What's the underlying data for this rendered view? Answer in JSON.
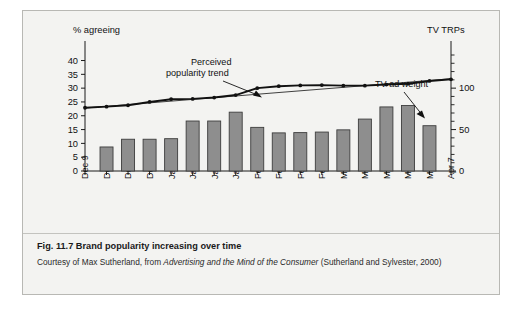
{
  "figure": {
    "caption_number": "Fig. 11.7",
    "caption_title": "Brand popularity increasing over time",
    "credit_prefix": "Courtesy of Max Sutherland, from ",
    "credit_italic": "Advertising and the Mind of the Consumer",
    "credit_suffix": " (Sutherland and Sylvester, 2000)"
  },
  "chart_data": {
    "type": "bar",
    "title": "Brand popularity increasing over time",
    "xlabel": "",
    "ylabel": "% agreeing",
    "y2label": "TV TRPs",
    "grid": false,
    "legend": "none",
    "ylim": [
      0,
      42
    ],
    "y2lim": [
      0,
      140
    ],
    "yticks": [
      0,
      5,
      10,
      15,
      20,
      25,
      30,
      35,
      40
    ],
    "yticklabels": [
      "0",
      "5",
      "10",
      "15",
      "20",
      "25",
      "30",
      "35",
      "40"
    ],
    "y2ticks": [
      0,
      10,
      20,
      30,
      40,
      50,
      60,
      70,
      80,
      90,
      100,
      110,
      120,
      130,
      140
    ],
    "y2ticklabels_shown": [
      "0",
      "50",
      "100"
    ],
    "y2ticklabel_values": [
      0,
      50,
      100
    ],
    "categories": [
      "Dec 9",
      "Dec 16",
      "Dec 23",
      "Dec 30",
      "Jan 6",
      "Jan 13",
      "Jan 20",
      "Jan 27",
      "Feb 3",
      "Feb 10",
      "Feb 17",
      "Feb 24",
      "Mar 3",
      "Mar 10",
      "Mar 17",
      "Mar 24",
      "Mar 31",
      "Apr 7"
    ],
    "series": [
      {
        "name": "TV ad weight",
        "type": "bar",
        "axis": "right",
        "unit": "TRPs",
        "values": [
          null,
          30,
          40,
          40,
          41,
          63,
          63,
          74,
          55,
          48,
          48,
          49,
          52,
          65,
          81,
          82,
          57,
          null
        ],
        "values_left_scale": [
          null,
          8.7,
          11.5,
          11.5,
          11.7,
          18.1,
          18.1,
          21.3,
          15.8,
          13.8,
          13.9,
          14.1,
          14.9,
          18.8,
          23.2,
          23.7,
          16.4,
          null
        ]
      },
      {
        "name": "Perceived popularity trend",
        "type": "line",
        "axis": "left",
        "unit": "% agreeing",
        "values": [
          22.9,
          23.3,
          23.8,
          25.0,
          26.0,
          26.1,
          26.6,
          27.5,
          30.0,
          30.7,
          31.0,
          31.1,
          30.9,
          30.9,
          31.3,
          31.6,
          32.6,
          33.2
        ]
      },
      {
        "name": "Linear trend overlay",
        "type": "line",
        "axis": "left",
        "values_endpoints": [
          22.8,
          33.4
        ]
      }
    ],
    "annotations": [
      {
        "text": "Perceived popularity trend",
        "text_line1": "Perceived",
        "text_line2": "popularity trend",
        "points_to": "Perceived popularity trend line"
      },
      {
        "text": "TV ad weight",
        "points_to": "Mar 31 bar"
      }
    ]
  }
}
